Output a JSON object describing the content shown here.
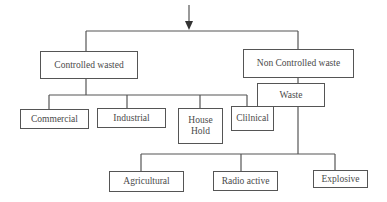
{
  "diagram": {
    "type": "tree",
    "title": "",
    "colors": {
      "line": "#555555",
      "text": "#4a4a4a",
      "background": "#ffffff"
    },
    "root_arrow": "arrow-down",
    "nodes": {
      "controlled": "Controlled wasted",
      "non_controlled": "Non Controlled waste",
      "waste": "Waste",
      "commercial": "Commercial",
      "industrial": "Industrial",
      "household": "House Hold",
      "clinical": "Clilnical",
      "agricultural": "Agricultural",
      "radioactive": "Radio active",
      "explosive": "Explosive"
    },
    "edges": [
      [
        "root",
        "controlled"
      ],
      [
        "root",
        "non_controlled"
      ],
      [
        "controlled",
        "commercial"
      ],
      [
        "controlled",
        "industrial"
      ],
      [
        "controlled",
        "household"
      ],
      [
        "controlled",
        "clinical"
      ],
      [
        "non_controlled",
        "waste"
      ],
      [
        "waste",
        "agricultural"
      ],
      [
        "waste",
        "radioactive"
      ],
      [
        "waste",
        "explosive"
      ]
    ]
  }
}
